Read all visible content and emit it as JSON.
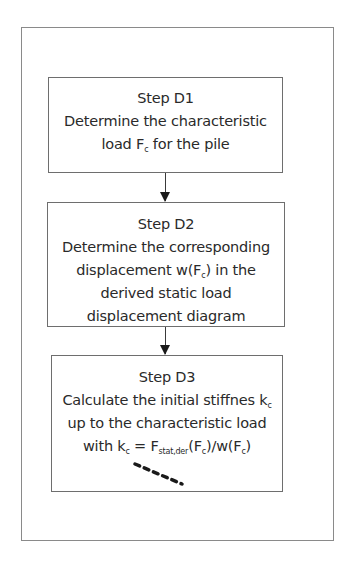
{
  "diagram": {
    "type": "flowchart",
    "steps": [
      {
        "id": "D1",
        "title": "Step D1",
        "lines": [
          "Determine the characteristic",
          "load F",
          "c",
          " for the pile"
        ]
      },
      {
        "id": "D2",
        "title": "Step D2",
        "lines": [
          "Determine the corresponding",
          "displacement w(F",
          "c",
          ") in the",
          "derived static load",
          "displacement diagram"
        ]
      },
      {
        "id": "D3",
        "title": "Step D3",
        "lines": [
          "Calculate the initial stiffnes k",
          "c",
          "up to the characteristic load",
          "with k",
          "c",
          " = F",
          "stat,der",
          "(F",
          "c",
          ")/w(F",
          "c",
          ")"
        ]
      }
    ],
    "edges": [
      {
        "from": "D1",
        "to": "D2"
      },
      {
        "from": "D2",
        "to": "D3"
      }
    ],
    "continuation": "dashed-line"
  }
}
